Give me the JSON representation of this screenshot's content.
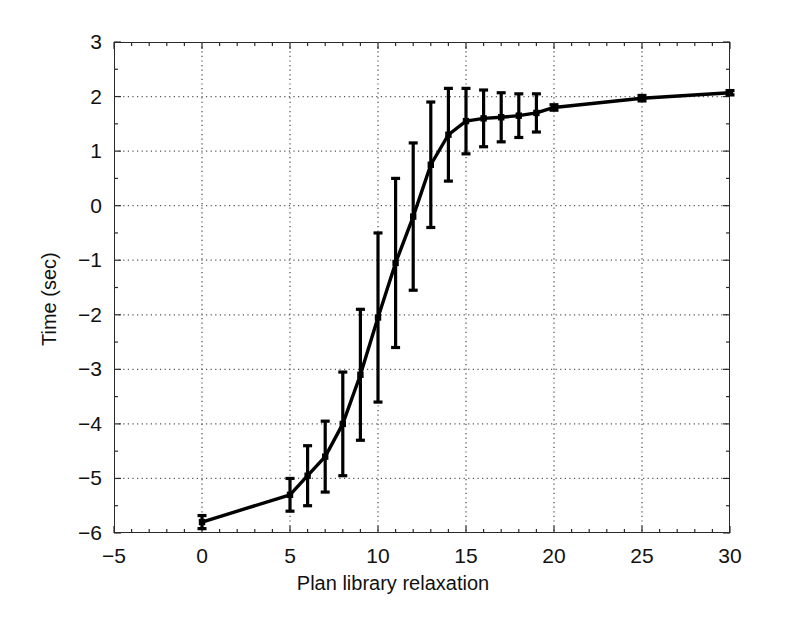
{
  "figure": {
    "background": "#ffffff",
    "axis_color": "#2a2a2a",
    "grid_color": "#555555",
    "series_color": "#000000"
  },
  "chart_data": {
    "type": "line",
    "title": "",
    "subtitle": "",
    "xlabel": "Plan library relaxation",
    "ylabel": "Time (sec)",
    "xlim": [
      -5,
      30
    ],
    "ylim": [
      -6,
      3
    ],
    "xticks": [
      -5,
      0,
      5,
      10,
      15,
      20,
      25,
      30
    ],
    "xticklabels": [
      "−5",
      "0",
      "5",
      "10",
      "15",
      "20",
      "25",
      "30"
    ],
    "yticks": [
      -6,
      -5,
      -4,
      -3,
      -2,
      -1,
      0,
      1,
      2,
      3
    ],
    "yticklabels": [
      "−6",
      "−5",
      "−4",
      "−3",
      "−2",
      "−1",
      "0",
      "1",
      "2",
      "3"
    ],
    "grid": true,
    "grid_style": "dotted",
    "legend": null,
    "legend_position": "none",
    "marker": "square",
    "error_bars": true,
    "x": [
      0,
      5,
      6,
      7,
      8,
      9,
      10,
      11,
      12,
      13,
      14,
      15,
      16,
      17,
      18,
      19,
      20,
      25,
      30
    ],
    "y": [
      -5.8,
      -5.3,
      -4.95,
      -4.6,
      -4.0,
      -3.1,
      -2.05,
      -1.05,
      -0.2,
      0.75,
      1.3,
      1.55,
      1.6,
      1.62,
      1.65,
      1.7,
      1.8,
      1.97,
      2.07
    ],
    "yerr": [
      0.12,
      0.3,
      0.55,
      0.65,
      0.95,
      1.2,
      1.55,
      1.55,
      1.35,
      1.15,
      0.85,
      0.6,
      0.52,
      0.45,
      0.4,
      0.35,
      0.05,
      0.05,
      0.04
    ],
    "series": [
      {
        "name": "Time (sec)",
        "values": [
          -5.8,
          -5.3,
          -4.95,
          -4.6,
          -4.0,
          -3.1,
          -2.05,
          -1.05,
          -0.2,
          0.75,
          1.3,
          1.55,
          1.6,
          1.62,
          1.65,
          1.7,
          1.8,
          1.97,
          2.07
        ],
        "errors": [
          0.12,
          0.3,
          0.55,
          0.65,
          0.95,
          1.2,
          1.55,
          1.55,
          1.35,
          1.15,
          0.85,
          0.6,
          0.52,
          0.45,
          0.4,
          0.35,
          0.05,
          0.05,
          0.04
        ]
      }
    ]
  }
}
